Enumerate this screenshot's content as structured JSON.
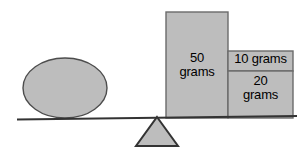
{
  "diagram": {
    "colors": {
      "fill": "#bdbdbd",
      "stroke": "#4d4d4d",
      "beam": "#333333",
      "background": "#ffffff",
      "text": "#000000"
    },
    "beam": {
      "name": "balance-beam",
      "left_x": 17,
      "left_y": 119,
      "right_x": 297,
      "right_y": 116
    },
    "fulcrum": {
      "name": "fulcrum-triangle",
      "apex_x": 157,
      "apex_y": 117,
      "base_left_x": 136,
      "base_right_x": 178,
      "base_y": 146
    },
    "ellipse": {
      "name": "unknown-mass-ellipse",
      "cx": 65,
      "cy": 88,
      "rx": 42,
      "ry": 30
    },
    "weights": [
      {
        "name": "weight-block-50",
        "label_line1": "50",
        "label_line2": "grams",
        "x": 166,
        "y": 12,
        "width": 62,
        "height": 106
      },
      {
        "name": "weight-block-10",
        "label_line1": "10 grams",
        "label_line2": "",
        "x": 228,
        "y": 51,
        "width": 65,
        "height": 20
      },
      {
        "name": "weight-block-20",
        "label_line1": "20",
        "label_line2": "grams",
        "x": 228,
        "y": 71,
        "width": 65,
        "height": 47
      }
    ]
  }
}
